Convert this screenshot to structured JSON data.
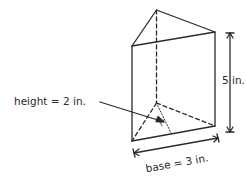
{
  "figure": {
    "type": "triangular-prism",
    "labels": {
      "triangle_height": "height = 2  in.",
      "prism_length": "5 in.",
      "triangle_base": "base = 3 in."
    },
    "colors": {
      "stroke": "#2a2a2a",
      "background": "#ffffff"
    }
  }
}
